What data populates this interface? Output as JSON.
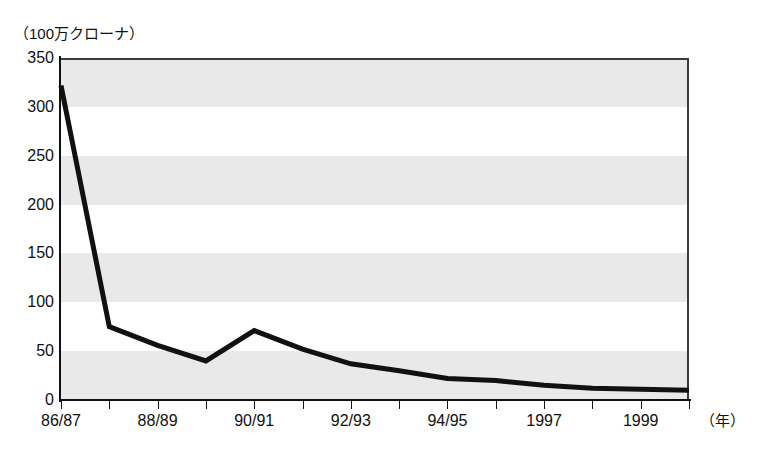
{
  "chart_data": {
    "type": "line",
    "title": "",
    "ylabel": "（100万クローナ）",
    "xlabel": "（年）",
    "ylim": [
      0,
      350
    ],
    "ytick_step": 50,
    "yticks": [
      "0",
      "50",
      "100",
      "150",
      "200",
      "250",
      "300",
      "350"
    ],
    "grid": "alternating-horizontal-bands",
    "legend": "none",
    "categories": [
      "86/87",
      "87/88",
      "88/89",
      "89/90",
      "90/91",
      "91/92",
      "92/93",
      "93/94",
      "94/95",
      "95/96",
      "1997",
      "1998",
      "1999",
      "2000"
    ],
    "xtick_labels_shown": [
      "86/87",
      "88/89",
      "90/91",
      "92/93",
      "94/95",
      "1997",
      "1999"
    ],
    "series": [
      {
        "name": "",
        "values": [
          322,
          75,
          56,
          40,
          71,
          52,
          37,
          30,
          22,
          20,
          15,
          12,
          11,
          10
        ]
      }
    ],
    "colors": {
      "line": "#111111",
      "band": "#e9e9e9",
      "axis": "#111111",
      "frame": "#3a3a3a"
    }
  },
  "axis": {
    "unit_caption": "（100万クローナ）",
    "x_unit": "（年）"
  }
}
